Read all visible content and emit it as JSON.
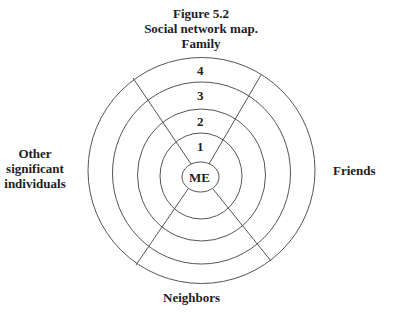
{
  "figure": {
    "number": "Figure 5.2",
    "caption": "Social network map."
  },
  "sectors": {
    "top": "Family",
    "right": "Friends",
    "bottom": "Neighbors",
    "left": [
      "Other",
      "significant",
      "individuals"
    ]
  },
  "center_label": "ME",
  "rings": [
    "1",
    "2",
    "3",
    "4"
  ],
  "colors": {
    "line": "#555555",
    "text": "#1e1e1e",
    "background": "#ffffff"
  }
}
